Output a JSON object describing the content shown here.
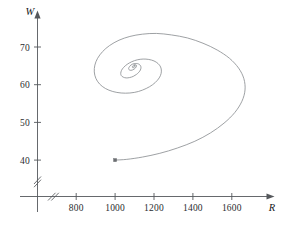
{
  "figure": {
    "background_color": "#ffffff",
    "curve_color": "#8d9094",
    "axis_color": "#55588c",
    "width": 288,
    "height": 228
  },
  "axes": {
    "x_label": "R",
    "y_label": "W",
    "x_ticks": [
      "800",
      "1000",
      "1200",
      "1400",
      "1600"
    ],
    "y_ticks": [
      "70",
      "60",
      "50",
      "40"
    ],
    "x_axis_break": "//",
    "y_axis_break": "//"
  },
  "chart_data": {
    "type": "line",
    "title": "",
    "subtitle": "",
    "xlabel": "R",
    "ylabel": "W",
    "grid": false,
    "legend": "none",
    "axis_break": true,
    "xlim": [
      640,
      1800
    ],
    "ylim": [
      36,
      78
    ],
    "xticks": [
      800,
      1000,
      1200,
      1400,
      1600
    ],
    "yticks": [
      40,
      50,
      60,
      70
    ],
    "annotations": [
      {
        "label": "start point",
        "x": 1000,
        "y": 40,
        "marker": "square"
      }
    ],
    "series": [
      {
        "name": "trajectory",
        "description": "Inward spiral phase-plane trajectory of W versus R, starting at (1000, 40) and converging to an equilibrium near (1100, 65).",
        "x": [
          1000,
          1060,
          1140,
          1230,
          1320,
          1410,
          1490,
          1560,
          1615,
          1652,
          1668,
          1662,
          1635,
          1588,
          1525,
          1452,
          1372,
          1290,
          1212,
          1140,
          1076,
          1020,
          972,
          936,
          910,
          896,
          893,
          901,
          920,
          950,
          988,
          1031,
          1076,
          1120,
          1160,
          1193,
          1218,
          1233,
          1238,
          1234,
          1221,
          1200,
          1173,
          1144,
          1114,
          1086,
          1062,
          1044,
          1033,
          1029,
          1032,
          1042,
          1057,
          1075,
          1093,
          1109,
          1122,
          1130,
          1133,
          1131,
          1124,
          1114,
          1103,
          1091,
          1081,
          1074,
          1070,
          1070,
          1074,
          1081,
          1089,
          1097,
          1104,
          1108,
          1110,
          1109,
          1105,
          1100,
          1095,
          1091,
          1089,
          1089,
          1091,
          1094,
          1098,
          1101,
          1103,
          1103,
          1101,
          1099,
          1097,
          1096,
          1096,
          1097,
          1098,
          1099,
          1100,
          1100
        ],
        "y": [
          40.0,
          40.2,
          40.8,
          41.8,
          43.2,
          45.0,
          47.2,
          49.8,
          52.6,
          55.6,
          58.6,
          61.6,
          64.4,
          67.0,
          69.2,
          71.0,
          72.4,
          73.2,
          73.6,
          73.4,
          72.8,
          71.8,
          70.4,
          68.8,
          67.0,
          65.2,
          63.4,
          61.7,
          60.2,
          59.0,
          58.2,
          57.8,
          57.8,
          58.2,
          59.0,
          60.0,
          61.2,
          62.4,
          63.6,
          64.7,
          65.6,
          66.3,
          66.7,
          66.8,
          66.6,
          66.1,
          65.4,
          64.6,
          63.8,
          63.0,
          62.4,
          62.0,
          61.8,
          61.9,
          62.2,
          62.7,
          63.3,
          63.9,
          64.5,
          65.0,
          65.4,
          65.6,
          65.6,
          65.5,
          65.2,
          64.8,
          64.4,
          64.1,
          63.9,
          63.8,
          63.9,
          64.1,
          64.4,
          64.7,
          65.0,
          65.2,
          65.3,
          65.3,
          65.2,
          65.0,
          64.8,
          64.6,
          64.5,
          64.5,
          64.6,
          64.8,
          64.9,
          65.1,
          65.1,
          65.1,
          65.0,
          64.9,
          64.9,
          64.9,
          64.9,
          65.0,
          65.0,
          65.0
        ]
      }
    ]
  }
}
